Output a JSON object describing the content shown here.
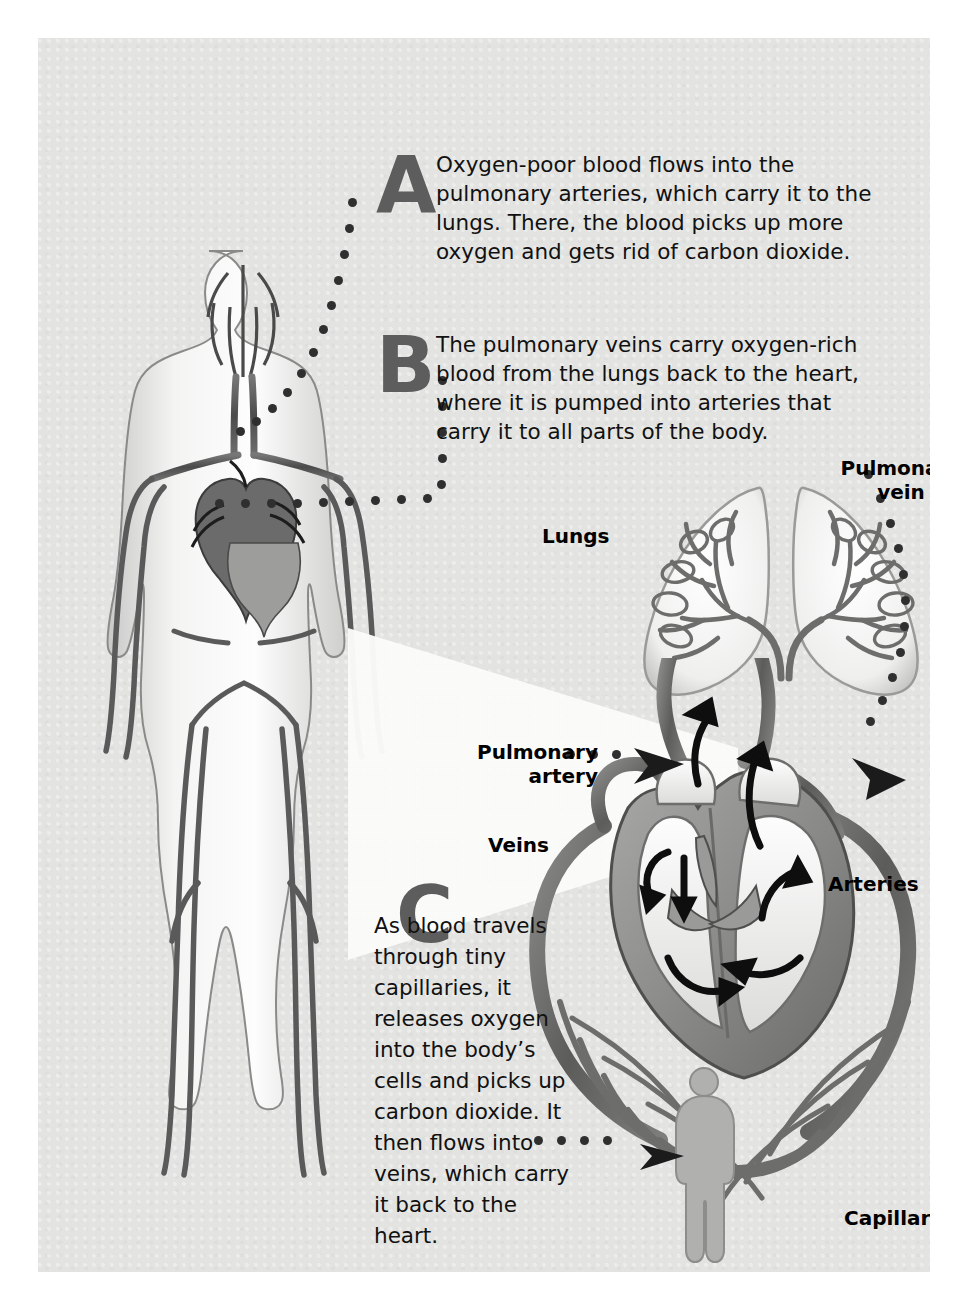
{
  "figure": {
    "background_color": "#e3e3e1",
    "page_color": "#ffffff",
    "ink_color": "#4a4a4a",
    "letter_color": "#5d5d5d"
  },
  "callouts": [
    {
      "letter": "A",
      "text": "Oxygen-poor blood flows into the pulmonary arteries, which carry it to the lungs. There, the blood picks up more oxygen and gets rid of carbon dioxide."
    },
    {
      "letter": "B",
      "text": "The pulmonary veins carry oxygen-rich blood from the lungs back to the heart, where it is pumped into arteries that carry it to all parts of the body."
    },
    {
      "letter": "C",
      "text": "As blood travels through tiny capillaries, it releases oxygen into the body’s cells and picks up carbon dioxide. It then flows into veins, which carry it back to the heart."
    }
  ],
  "labels": {
    "pulmonary_vein": "Pulmonary\nvein",
    "pulmonary_vein_line1": "Pulmonary",
    "pulmonary_vein_line2": "vein",
    "lungs": "Lungs",
    "pulmonary_artery_line1": "Pulmonary",
    "pulmonary_artery_line2": "artery",
    "veins": "Veins",
    "arteries": "Arteries",
    "capillaries": "Capillaries"
  },
  "illustrations": {
    "body_figure": "full-body-circulatory-system",
    "heart_detail": "heart-cross-section-with-flow-arrows",
    "lungs": "pair-of-lungs-with-bronchial-vessels",
    "capillary_bed": "capillary-network-with-small-human-silhouette"
  }
}
